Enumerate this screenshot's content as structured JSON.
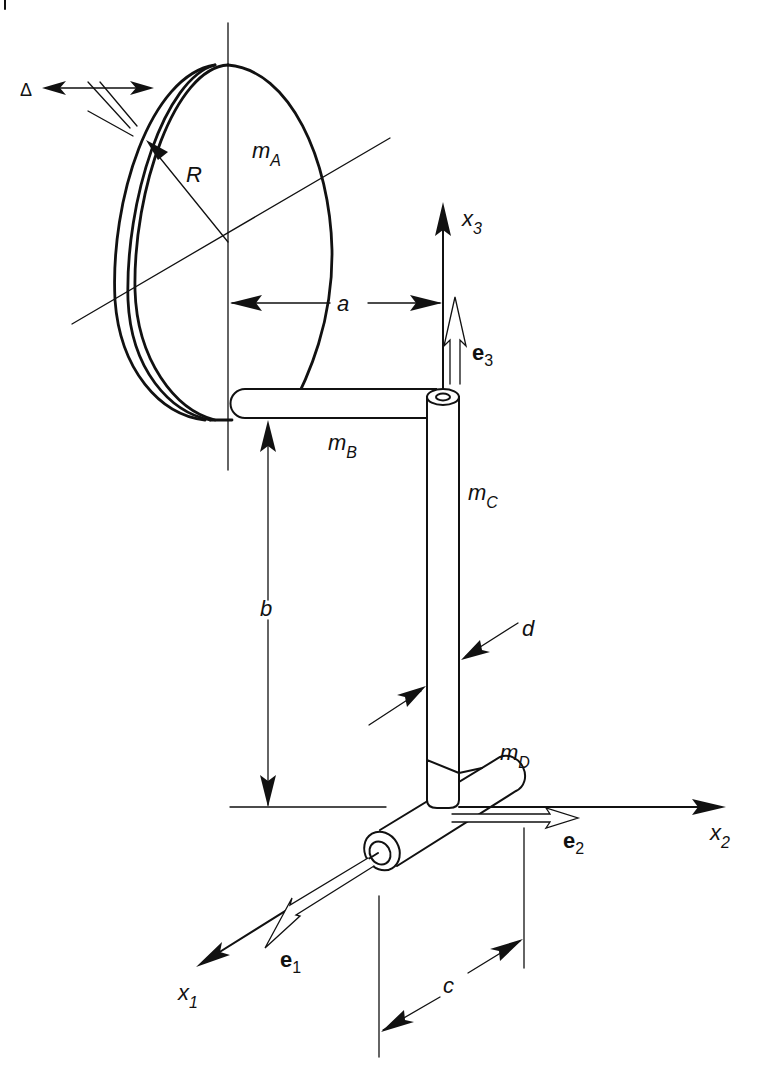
{
  "figure": {
    "colors": {
      "ink": "#111111",
      "background": "#ffffff"
    }
  },
  "labels": {
    "delta": "Δ",
    "radius": "R",
    "mass_A": {
      "base": "m",
      "sub": "A"
    },
    "mass_B": {
      "base": "m",
      "sub": "B"
    },
    "mass_C": {
      "base": "m",
      "sub": "C"
    },
    "mass_D": {
      "base": "m",
      "sub": "D"
    },
    "dim_a": "a",
    "dim_b": "b",
    "dim_c": "c",
    "dim_d": "d",
    "axis_x1": {
      "base": "x",
      "sub": "1"
    },
    "axis_x2": {
      "base": "x",
      "sub": "2"
    },
    "axis_x3": {
      "base": "x",
      "sub": "3"
    },
    "vec_e1": {
      "base": "e",
      "sub": "1"
    },
    "vec_e2": {
      "base": "e",
      "sub": "2"
    },
    "vec_e3": {
      "base": "e",
      "sub": "3"
    }
  }
}
